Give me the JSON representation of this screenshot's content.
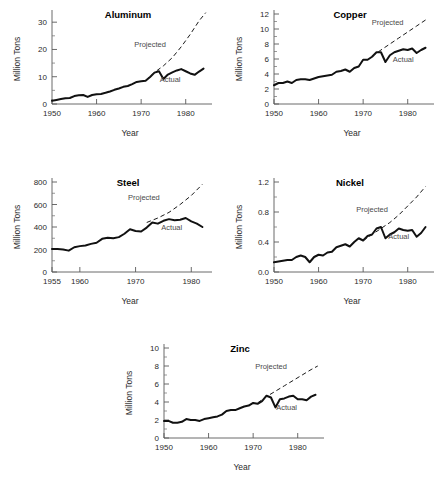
{
  "figure": {
    "background": "#ffffff",
    "panel_count": 5,
    "annotation_projected": "Projected",
    "annotation_actual": "Actual",
    "axis_label_x": "Year",
    "axis_label_y": "Million Tons"
  },
  "chart_data": [
    {
      "id": "aluminum",
      "type": "line",
      "title": "Aluminum",
      "xlabel": "Year",
      "ylabel": "Million Tons",
      "xlim": [
        1950,
        1985
      ],
      "ylim": [
        0,
        33
      ],
      "yticks": [
        0,
        10,
        20,
        30
      ],
      "ytick_labels": [
        "0",
        "10",
        "20",
        "30"
      ],
      "yminor_step": 5,
      "xticks": [
        1950,
        1960,
        1970,
        1980
      ],
      "xtick_labels": [
        "1950",
        "1960",
        "1970",
        "1980"
      ],
      "grid": false,
      "legend": "inline-annotations",
      "annotations": [
        {
          "text": "Projected",
          "x": 1972,
          "y": 21
        },
        {
          "text": "Actual",
          "x": 1976.5,
          "y": 8.2
        }
      ],
      "series": [
        {
          "name": "Actual",
          "style": "solid-thick",
          "x": [
            1950,
            1951,
            1952,
            1953,
            1954,
            1955,
            1956,
            1957,
            1958,
            1959,
            1960,
            1961,
            1962,
            1963,
            1964,
            1965,
            1966,
            1967,
            1968,
            1969,
            1970,
            1971,
            1972,
            1973,
            1974,
            1975,
            1976,
            1977,
            1978,
            1979,
            1980,
            1981,
            1982,
            1983,
            1984
          ],
          "values": [
            1.2,
            1.5,
            1.8,
            2.1,
            2.2,
            2.9,
            3.2,
            3.3,
            2.6,
            3.3,
            3.6,
            3.7,
            4.1,
            4.6,
            5.2,
            5.7,
            6.3,
            6.6,
            7.3,
            8.1,
            8.3,
            8.5,
            9.9,
            11.5,
            12.0,
            9.2,
            10.8,
            11.6,
            12.3,
            12.8,
            12.0,
            11.2,
            10.7,
            11.9,
            13.0
          ]
        },
        {
          "name": "Projected",
          "style": "dashed",
          "x": [
            1971,
            1973,
            1975,
            1977,
            1979,
            1981,
            1983,
            1984.5
          ],
          "values": [
            8.6,
            11.6,
            14.0,
            17.0,
            21.0,
            25.5,
            30.5,
            33.5
          ]
        }
      ]
    },
    {
      "id": "copper",
      "type": "line",
      "title": "Copper",
      "xlabel": "Year",
      "ylabel": "Million Tons",
      "xlim": [
        1950,
        1985
      ],
      "ylim": [
        0,
        12
      ],
      "yticks": [
        0,
        2,
        4,
        6,
        8,
        10,
        12
      ],
      "ytick_labels": [
        "0",
        "2",
        "4",
        "6",
        "8",
        "10",
        "12"
      ],
      "yminor_step": 1,
      "xticks": [
        1950,
        1960,
        1970,
        1980
      ],
      "xtick_labels": [
        "1950",
        "1960",
        "1970",
        "1980"
      ],
      "grid": false,
      "legend": "inline-annotations",
      "annotations": [
        {
          "text": "Projected",
          "x": 1975.5,
          "y": 10.6
        },
        {
          "text": "Actual",
          "x": 1979,
          "y": 5.6
        }
      ],
      "series": [
        {
          "name": "Actual",
          "style": "solid-thick",
          "x": [
            1950,
            1951,
            1952,
            1953,
            1954,
            1955,
            1956,
            1957,
            1958,
            1959,
            1960,
            1961,
            1962,
            1963,
            1964,
            1965,
            1966,
            1967,
            1968,
            1969,
            1970,
            1971,
            1972,
            1973,
            1974,
            1975,
            1976,
            1977,
            1978,
            1979,
            1980,
            1981,
            1982,
            1983,
            1984
          ],
          "values": [
            2.5,
            2.8,
            2.8,
            3.0,
            2.8,
            3.2,
            3.3,
            3.3,
            3.2,
            3.4,
            3.6,
            3.7,
            3.8,
            3.9,
            4.3,
            4.4,
            4.6,
            4.3,
            4.8,
            5.0,
            5.9,
            5.9,
            6.3,
            6.9,
            6.9,
            5.6,
            6.5,
            6.9,
            7.1,
            7.3,
            7.2,
            7.4,
            6.8,
            7.2,
            7.5
          ]
        },
        {
          "name": "Projected",
          "style": "dashed",
          "x": [
            1972,
            1974,
            1976,
            1978,
            1980,
            1982,
            1984.5
          ],
          "values": [
            6.4,
            7.2,
            8.0,
            8.8,
            9.6,
            10.4,
            11.4
          ]
        }
      ]
    },
    {
      "id": "steel",
      "type": "line",
      "title": "Steel",
      "xlabel": "Year",
      "ylabel": "Million Tons",
      "xlim": [
        1955,
        1983
      ],
      "ylim": [
        0,
        800
      ],
      "yticks": [
        0,
        200,
        400,
        600,
        800
      ],
      "ytick_labels": [
        "0",
        "200",
        "400",
        "600",
        "800"
      ],
      "yminor_step": 100,
      "xticks": [
        1955,
        1960,
        1970,
        1980
      ],
      "xtick_labels": [
        "1955",
        "1960",
        "1970",
        "1980"
      ],
      "grid": false,
      "legend": "inline-annotations",
      "annotations": [
        {
          "text": "Projected",
          "x": 1971.5,
          "y": 640
        },
        {
          "text": "Actual",
          "x": 1976.5,
          "y": 375
        }
      ],
      "series": [
        {
          "name": "Actual",
          "style": "solid-thick",
          "x": [
            1955,
            1956,
            1957,
            1958,
            1959,
            1960,
            1961,
            1962,
            1963,
            1964,
            1965,
            1966,
            1967,
            1968,
            1969,
            1970,
            1971,
            1972,
            1973,
            1974,
            1975,
            1976,
            1977,
            1978,
            1979,
            1980,
            1981,
            1982
          ],
          "values": [
            205,
            205,
            200,
            190,
            220,
            230,
            235,
            250,
            260,
            295,
            305,
            300,
            310,
            340,
            380,
            365,
            360,
            395,
            440,
            430,
            455,
            470,
            460,
            465,
            480,
            450,
            430,
            400
          ]
        },
        {
          "name": "Projected",
          "style": "dashed",
          "x": [
            1972,
            1974,
            1976,
            1978,
            1980,
            1982
          ],
          "values": [
            440,
            480,
            530,
            600,
            680,
            780
          ]
        }
      ]
    },
    {
      "id": "nickel",
      "type": "line",
      "title": "Nickel",
      "xlabel": "Year",
      "ylabel": "Million Tons",
      "xlim": [
        1950,
        1985
      ],
      "ylim": [
        0,
        1.2
      ],
      "yticks": [
        0.0,
        0.4,
        0.8,
        1.2
      ],
      "ytick_labels": [
        "0.0",
        "0.4",
        "0.8",
        "1.2"
      ],
      "yminor_step": 0.2,
      "xticks": [
        1950,
        1960,
        1970,
        1980
      ],
      "xtick_labels": [
        "1950",
        "1960",
        "1970",
        "1980"
      ],
      "grid": false,
      "legend": "inline-annotations",
      "annotations": [
        {
          "text": "Projected",
          "x": 1972,
          "y": 0.8
        },
        {
          "text": "Actual",
          "x": 1978,
          "y": 0.44
        }
      ],
      "series": [
        {
          "name": "Actual",
          "style": "solid-thick",
          "x": [
            1950,
            1951,
            1952,
            1953,
            1954,
            1955,
            1956,
            1957,
            1958,
            1959,
            1960,
            1961,
            1962,
            1963,
            1964,
            1965,
            1966,
            1967,
            1968,
            1969,
            1970,
            1971,
            1972,
            1973,
            1974,
            1975,
            1976,
            1977,
            1978,
            1979,
            1980,
            1981,
            1982,
            1983,
            1984
          ],
          "values": [
            0.13,
            0.14,
            0.15,
            0.16,
            0.16,
            0.2,
            0.22,
            0.2,
            0.13,
            0.2,
            0.23,
            0.22,
            0.26,
            0.27,
            0.33,
            0.35,
            0.37,
            0.34,
            0.4,
            0.45,
            0.42,
            0.48,
            0.5,
            0.58,
            0.6,
            0.45,
            0.5,
            0.53,
            0.58,
            0.56,
            0.55,
            0.56,
            0.47,
            0.52,
            0.6
          ]
        },
        {
          "name": "Projected",
          "style": "dashed",
          "x": [
            1970,
            1972,
            1974,
            1976,
            1978,
            1980,
            1982,
            1984
          ],
          "values": [
            0.42,
            0.5,
            0.58,
            0.66,
            0.76,
            0.88,
            1.0,
            1.14
          ]
        }
      ]
    },
    {
      "id": "zinc",
      "type": "line",
      "title": "Zinc",
      "xlabel": "Year",
      "ylabel": "Million Tons",
      "xlim": [
        1950,
        1985
      ],
      "ylim": [
        0,
        10
      ],
      "yticks": [
        0,
        2,
        4,
        6,
        8,
        10
      ],
      "ytick_labels": [
        "0",
        "2",
        "4",
        "6",
        "8",
        "10"
      ],
      "yminor_step": 1,
      "xticks": [
        1950,
        1960,
        1970,
        1980
      ],
      "xtick_labels": [
        "1950",
        "1960",
        "1970",
        "1980"
      ],
      "grid": false,
      "legend": "inline-annotations",
      "annotations": [
        {
          "text": "Projected",
          "x": 1974,
          "y": 7.7
        },
        {
          "text": "Actual",
          "x": 1977.5,
          "y": 3.1
        }
      ],
      "series": [
        {
          "name": "Actual",
          "style": "solid-thick",
          "x": [
            1950,
            1951,
            1952,
            1953,
            1954,
            1955,
            1956,
            1957,
            1958,
            1959,
            1960,
            1961,
            1962,
            1963,
            1964,
            1965,
            1966,
            1967,
            1968,
            1969,
            1970,
            1971,
            1972,
            1973,
            1974,
            1975,
            1976,
            1977,
            1978,
            1979,
            1980,
            1981,
            1982,
            1983,
            1984
          ],
          "values": [
            1.9,
            1.9,
            1.7,
            1.7,
            1.8,
            2.1,
            2.0,
            2.0,
            1.9,
            2.1,
            2.2,
            2.3,
            2.4,
            2.6,
            3.0,
            3.1,
            3.1,
            3.3,
            3.5,
            3.6,
            3.9,
            3.8,
            4.1,
            4.7,
            4.5,
            3.4,
            4.3,
            4.4,
            4.6,
            4.7,
            4.3,
            4.3,
            4.2,
            4.6,
            4.8
          ]
        },
        {
          "name": "Projected",
          "style": "dashed",
          "x": [
            1971,
            1973,
            1975,
            1977,
            1979,
            1981,
            1983,
            1984.5
          ],
          "values": [
            3.9,
            4.6,
            5.2,
            5.8,
            6.4,
            7.0,
            7.6,
            8.0
          ]
        }
      ]
    }
  ]
}
